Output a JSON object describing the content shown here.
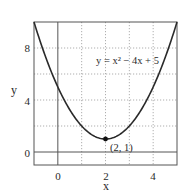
{
  "chart_data": {
    "type": "line",
    "title": "",
    "xlabel": "x",
    "ylabel": "y",
    "xlim": [
      -1,
      5
    ],
    "ylim": [
      -1,
      10
    ],
    "grid": true,
    "grid_style": "dotted",
    "x_gridlines": [
      1,
      2,
      3,
      4
    ],
    "y_gridlines": [
      2,
      4,
      6,
      8
    ],
    "x_ticks": [
      0,
      2,
      4
    ],
    "x_tick_labels": [
      "0",
      "2",
      "4"
    ],
    "y_ticks": [
      0,
      4,
      8
    ],
    "y_tick_labels": [
      "0",
      "4",
      "8"
    ],
    "reference_lines": [
      {
        "axis": "x",
        "value": 0
      },
      {
        "axis": "y",
        "value": 0
      }
    ],
    "series": [
      {
        "name": "y = x² − 4x + 5",
        "expression": "x^2 - 4x + 5",
        "x": [
          -1,
          -0.5,
          0,
          0.5,
          1,
          1.5,
          2,
          2.5,
          3,
          3.5,
          4,
          4.5,
          5
        ],
        "y": [
          10,
          7.25,
          5,
          3.25,
          2,
          1.25,
          1,
          1.25,
          2,
          3.25,
          5,
          7.25,
          10
        ],
        "color": "#2a2a2a"
      }
    ],
    "annotations": [
      {
        "text": "y = x² − 4x + 5",
        "x": 3.3,
        "y": 7.6
      },
      {
        "text": "(2, 1)",
        "x": 2,
        "y": 1,
        "marker": "dot"
      }
    ],
    "legend": "none"
  },
  "labels": {
    "xlabel": "x",
    "ylabel": "y",
    "equation": "y = x² − 4x + 5",
    "vertex": "(2, 1)",
    "xtick0": "0",
    "xtick2": "2",
    "xtick4": "4",
    "ytick0": "0",
    "ytick4": "4",
    "ytick8": "8"
  }
}
